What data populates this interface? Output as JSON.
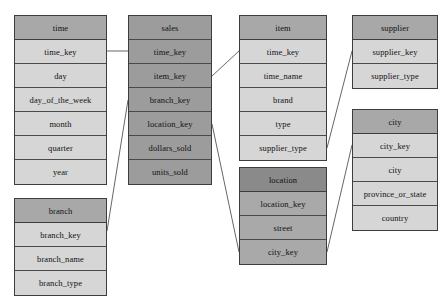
{
  "diagram": {
    "type": "snowflake-schema",
    "title": "",
    "canvas": {
      "width": 448,
      "height": 304,
      "background": "#ffffff"
    },
    "colors": {
      "fact_fill": "#9c9c9c",
      "dimension_header_fill": "#a8a8a8",
      "dimension_body_fill": "#d6d6d6",
      "location_header_fill": "#8a8a8a",
      "location_body_fill": "#a9a9a9",
      "border": "#3d3d3d",
      "connector": "#555555"
    },
    "tables": [
      {
        "id": "time",
        "name": "time",
        "kind": "dimension",
        "x": 14,
        "y": 15,
        "width": 93,
        "rowHeight": 24,
        "fields": [
          "time_key",
          "day",
          "day_of_the_week",
          "month",
          "quarter",
          "year"
        ]
      },
      {
        "id": "sales",
        "name": "sales",
        "kind": "fact",
        "x": 128,
        "y": 15,
        "width": 84,
        "rowHeight": 24,
        "fields": [
          "time_key",
          "item_key",
          "branch_key",
          "location_key",
          "dollars_sold",
          "units_sold"
        ]
      },
      {
        "id": "item",
        "name": "item",
        "kind": "dimension",
        "x": 239,
        "y": 15,
        "width": 88,
        "rowHeight": 24,
        "fields": [
          "time_key",
          "time_name",
          "brand",
          "type",
          "supplier_type"
        ]
      },
      {
        "id": "supplier",
        "name": "supplier",
        "kind": "dimension",
        "x": 352,
        "y": 15,
        "width": 86,
        "rowHeight": 24,
        "fields": [
          "supplier_key",
          "supplier_type"
        ]
      },
      {
        "id": "city",
        "name": "city",
        "kind": "dimension",
        "x": 352,
        "y": 109,
        "width": 86,
        "rowHeight": 24,
        "fields": [
          "city_key",
          "city",
          "province_or_state",
          "country"
        ]
      },
      {
        "id": "location",
        "name": "location",
        "kind": "location",
        "x": 239,
        "y": 167,
        "width": 88,
        "rowHeight": 24,
        "fields": [
          "location_key",
          "street",
          "city_key"
        ]
      },
      {
        "id": "branch",
        "name": "branch",
        "kind": "dimension",
        "x": 14,
        "y": 198,
        "width": 93,
        "rowHeight": 24,
        "fields": [
          "branch_key",
          "branch_name",
          "branch_type"
        ]
      }
    ],
    "relationships": [
      {
        "id": "time-sales",
        "from": "time.time_key",
        "to": "sales.time_key",
        "x1": 107,
        "y1": 51,
        "x2": 128,
        "y2": 51
      },
      {
        "id": "sales-item",
        "from": "sales.item_key",
        "to": "item.time_key",
        "x1": 212,
        "y1": 76,
        "x2": 239,
        "y2": 51
      },
      {
        "id": "branch-sales",
        "from": "branch.branch_key",
        "to": "sales.branch_key",
        "x1": 107,
        "y1": 231,
        "x2": 128,
        "y2": 100
      },
      {
        "id": "sales-location",
        "from": "sales.location_key",
        "to": "location.location_key",
        "x1": 212,
        "y1": 124,
        "x2": 239,
        "y2": 252
      },
      {
        "id": "item-supplier",
        "from": "item.supplier_type",
        "to": "supplier.supplier_key",
        "x1": 327,
        "y1": 148,
        "x2": 352,
        "y2": 51
      },
      {
        "id": "location-city",
        "from": "location.city_key",
        "to": "city.city_key",
        "x1": 327,
        "y1": 252,
        "x2": 352,
        "y2": 145
      }
    ]
  }
}
